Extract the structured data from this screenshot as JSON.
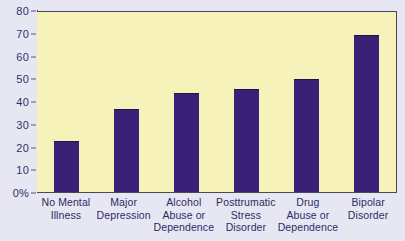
{
  "chart_data": {
    "type": "bar",
    "title": "",
    "subtitle": "",
    "xlabel": "",
    "ylabel": "",
    "categories": [
      "No Mental Illness",
      "Major Depression",
      "Alcohol Abuse or Dependence",
      "Posttrumatic Stress Disorder",
      "Drug Abuse or Dependence",
      "Bipolar Disorder"
    ],
    "category_lines": [
      [
        "No Mental",
        "Illness"
      ],
      [
        "Major",
        "Depression"
      ],
      [
        "Alcohol",
        "Abuse or",
        "Dependence"
      ],
      [
        "Posttrumatic",
        "Stress",
        "Disorder"
      ],
      [
        "Drug",
        "Abuse or",
        "Dependence"
      ],
      [
        "Bipolar",
        "Disorder"
      ]
    ],
    "values": [
      22.5,
      36.5,
      43.5,
      45.5,
      49.5,
      69
    ],
    "ylim": [
      0,
      80
    ],
    "ytick_labels": [
      "0%",
      "10",
      "20",
      "30",
      "40",
      "50",
      "60",
      "70",
      "80"
    ],
    "ytick_values": [
      0,
      10,
      20,
      30,
      40,
      50,
      60,
      70,
      80
    ],
    "grid": false,
    "legend": null,
    "annotations": [],
    "colors": {
      "bar": "#3b2078",
      "bar_edge": "#241048",
      "plot_background": "#f6f2b9",
      "figure_background": "#e7e7f4",
      "axis": "#55557f",
      "tick_label": "#30306a",
      "category_label": "#2c2c63"
    }
  }
}
